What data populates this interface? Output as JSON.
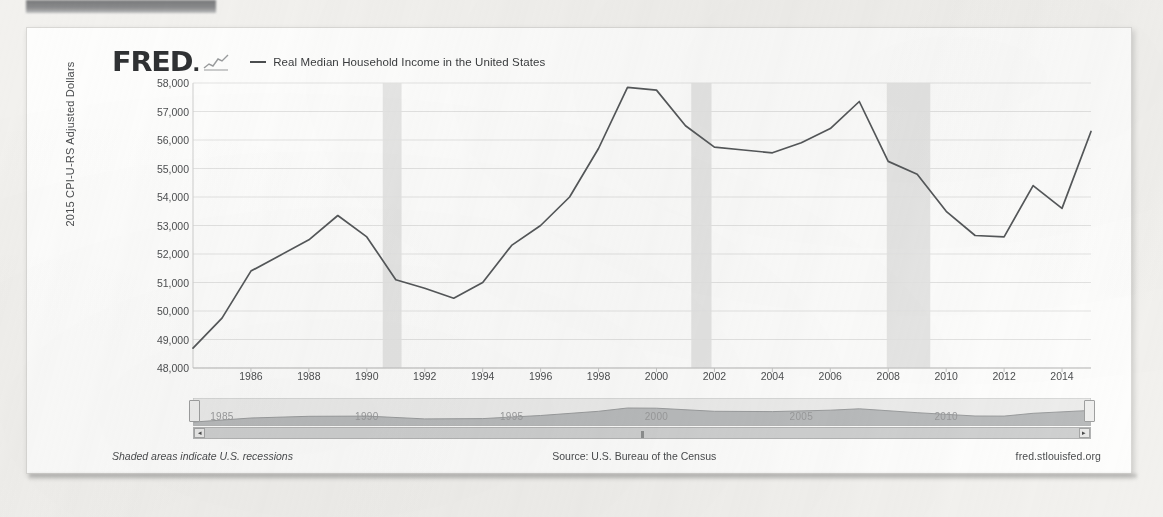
{
  "brand": {
    "logo_text": "FRED",
    "logo_dot": ".",
    "sparkline_icon": "sparkline-icon"
  },
  "legend": {
    "series_label": "Real Median Household Income in the United States",
    "line_color": "#55585a"
  },
  "axes": {
    "ylabel": "2015 CPI-U-RS Adjusted Dollars",
    "yticks": [
      "58,000",
      "57,000",
      "56,000",
      "55,000",
      "54,000",
      "53,000",
      "52,000",
      "51,000",
      "50,000",
      "49,000",
      "48,000"
    ],
    "xticks": [
      "1986",
      "1988",
      "1990",
      "1992",
      "1994",
      "1996",
      "1998",
      "2000",
      "2002",
      "2004",
      "2006",
      "2008",
      "2010",
      "2012",
      "2014"
    ]
  },
  "navigator": {
    "year_labels": [
      "1985",
      "1990",
      "1995",
      "2000",
      "2005",
      "2010"
    ],
    "left_arrow": "◂",
    "right_arrow": "▸",
    "grip": "|||",
    "left_handle": "navigator-left-handle",
    "right_handle": "navigator-right-handle"
  },
  "footer": {
    "recession_note": "Shaded areas indicate U.S. recessions",
    "source": "Source: U.S. Bureau of the Census",
    "url": "fred.stlouisfed.org"
  },
  "chart_data": {
    "type": "line",
    "title": "Real Median Household Income in the United States",
    "xlabel": "",
    "ylabel": "2015 CPI-U-RS Adjusted Dollars",
    "ylim": [
      48000,
      58000
    ],
    "xlim": [
      1984,
      2015
    ],
    "grid": true,
    "legend_position": "top",
    "line_color": "#55585a",
    "x": [
      1984,
      1985,
      1986,
      1987,
      1988,
      1989,
      1990,
      1991,
      1992,
      1993,
      1994,
      1995,
      1996,
      1997,
      1998,
      1999,
      2000,
      2001,
      2002,
      2003,
      2004,
      2005,
      2006,
      2007,
      2008,
      2009,
      2010,
      2011,
      2012,
      2013,
      2014,
      2015
    ],
    "values": [
      48700,
      49750,
      51400,
      51950,
      52500,
      53350,
      52600,
      51100,
      50800,
      50450,
      51000,
      52300,
      53000,
      54000,
      55700,
      57850,
      57750,
      56500,
      55750,
      55650,
      55550,
      55900,
      56400,
      57350,
      55250,
      54800,
      53500,
      52650,
      52600,
      54400,
      53600,
      56300
    ],
    "recessions": [
      {
        "start": 1990.55,
        "end": 1991.2
      },
      {
        "start": 2001.2,
        "end": 2001.9
      },
      {
        "start": 2007.95,
        "end": 2009.45
      }
    ],
    "navigator_series": {
      "x": [
        1984,
        1986,
        1988,
        1990,
        1992,
        1994,
        1996,
        1998,
        1999,
        2000,
        2002,
        2004,
        2006,
        2007,
        2009,
        2011,
        2012,
        2013,
        2015
      ],
      "values": [
        48700,
        51400,
        52500,
        52600,
        50800,
        51000,
        53000,
        55700,
        57850,
        57750,
        55750,
        55550,
        56400,
        57350,
        54800,
        52650,
        52600,
        54400,
        56300
      ]
    }
  }
}
